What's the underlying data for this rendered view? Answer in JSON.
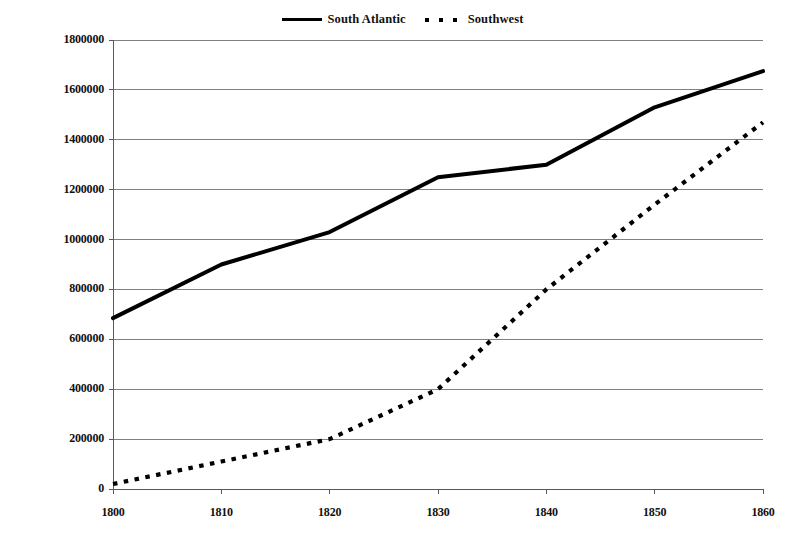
{
  "chart_data": {
    "type": "line",
    "title": "",
    "subtitle": "",
    "xlabel": "",
    "ylabel": "",
    "x": [
      1800,
      1810,
      1820,
      1830,
      1840,
      1850,
      1860
    ],
    "categories": [
      "1800",
      "1810",
      "1820",
      "1830",
      "1840",
      "1850",
      "1860"
    ],
    "series": [
      {
        "name": "South Atlantic",
        "style": "solid",
        "color": "#000000",
        "values": [
          685000,
          900000,
          1030000,
          1250000,
          1300000,
          1530000,
          1675000
        ]
      },
      {
        "name": "Southwest",
        "style": "dotted",
        "color": "#000000",
        "values": [
          20000,
          110000,
          200000,
          400000,
          800000,
          1140000,
          1470000
        ]
      }
    ],
    "xlim": [
      1800,
      1860
    ],
    "ylim": [
      0,
      1800000
    ],
    "ytick_values": [
      0,
      200000,
      400000,
      600000,
      800000,
      1000000,
      1200000,
      1400000,
      1600000,
      1800000
    ],
    "ytick_labels": [
      "0",
      "200000",
      "400000",
      "600000",
      "800000",
      "1000000",
      "1200000",
      "1400000",
      "1600000",
      "1800000"
    ],
    "xtick_labels": [
      "1800",
      "1810",
      "1820",
      "1830",
      "1840",
      "1850",
      "1860"
    ],
    "grid": {
      "horizontal": true,
      "vertical": false,
      "color": "#808080"
    },
    "legend": {
      "position": "top-center",
      "entries": [
        {
          "label": "South Atlantic",
          "marker": "solid-line-swatch"
        },
        {
          "label": "Southwest",
          "marker": "dotted-line-swatch"
        }
      ]
    },
    "axis_color": "#595959",
    "background": "#ffffff"
  }
}
